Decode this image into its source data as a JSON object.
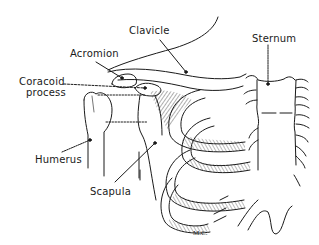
{
  "figure": {
    "labels": {
      "clavicle": "Clavicle",
      "acromion": "Acromion",
      "coracoid_line1": "Coracoid",
      "coracoid_line2": "process",
      "sternum": "Sternum",
      "humerus": "Humerus",
      "scapula": "Scapula"
    },
    "signature": "M.C.",
    "colors": {
      "ink": "#1a1a1a",
      "background": "#ffffff"
    }
  }
}
